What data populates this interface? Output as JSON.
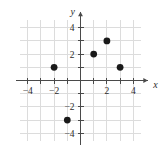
{
  "chart_data": {
    "type": "scatter",
    "title": "",
    "xlabel": "x",
    "ylabel": "y",
    "xlim": [
      -5.2,
      5.2
    ],
    "ylim": [
      -5.2,
      5.2
    ],
    "grid": true,
    "grid_step": 1,
    "legend": "none",
    "xticks": [
      -4,
      -2,
      2,
      4
    ],
    "xtick_labels": [
      "−4",
      "−2",
      "2",
      "4"
    ],
    "yticks": [
      -4,
      -2,
      2,
      4
    ],
    "ytick_labels": [
      "−4",
      "−2",
      "2",
      "4"
    ],
    "points": [
      {
        "label": "A",
        "x": -2,
        "y": 1
      },
      {
        "label": "B",
        "x": 1,
        "y": 2
      },
      {
        "label": "C",
        "x": 2,
        "y": 3
      },
      {
        "label": "D",
        "x": 3,
        "y": 1
      },
      {
        "label": "E",
        "x": -1,
        "y": -3
      }
    ],
    "marker": {
      "shape": "circle",
      "radius_px": 3.4,
      "color": "#1a1a1a"
    },
    "colors": {
      "grid": "#dcdcdc",
      "axis": "#4a4a4a",
      "point": "#1a1a1a",
      "text": "#2b2b2b",
      "background": "#ffffff"
    }
  },
  "axes": {
    "x_axis_name": "x",
    "y_axis_name": "y"
  }
}
